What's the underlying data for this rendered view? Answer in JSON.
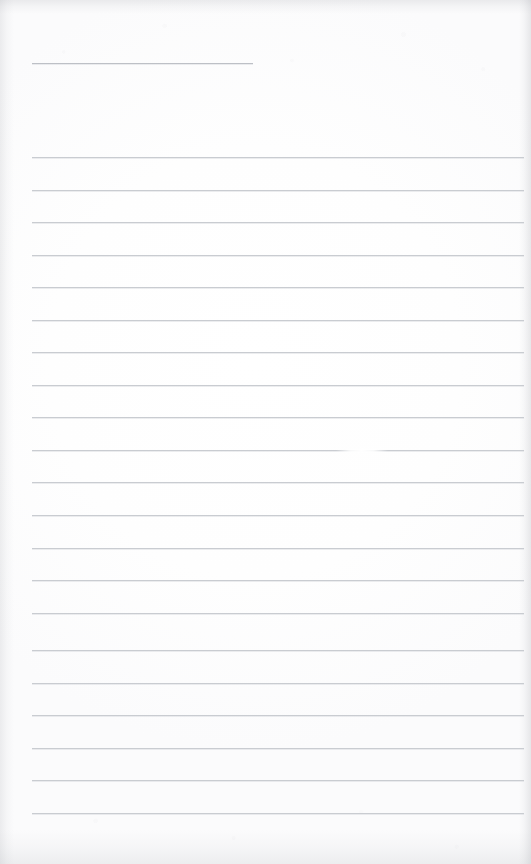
{
  "document": {
    "kind": "scanned-ruled-page",
    "title": "Blank ruled notepad page",
    "page_width": 531,
    "page_height": 864,
    "content_text": "",
    "colors": {
      "paper": "#fdfdfd",
      "rule_line": "#c9ccd1",
      "header_rule_line": "#bdc0c6",
      "edge_shadow": "#aaacb2"
    }
  },
  "header_rule": {
    "name": "header-rule",
    "x": 32,
    "y": 63,
    "width": 221
  },
  "rules": {
    "left": 32,
    "width": 492,
    "positions": [
      157,
      190,
      222,
      255,
      287,
      320,
      352,
      385,
      417,
      450,
      482,
      515,
      548,
      580,
      613,
      650,
      683,
      715,
      748,
      780,
      813
    ]
  },
  "artifacts": {
    "smudge": {
      "name": "line-smudge",
      "x": 336,
      "y": 450,
      "width": 52
    }
  }
}
